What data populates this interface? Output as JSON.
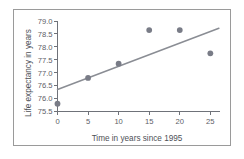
{
  "chart_data": {
    "type": "scatter",
    "title": "",
    "subtitle": "",
    "xlabel": "Time in years since 1995",
    "ylabel": "Life expectancy in years",
    "xlim": [
      0,
      26.5
    ],
    "ylim": [
      75.5,
      79.0
    ],
    "xticks": [
      0,
      5,
      10,
      15,
      20,
      25
    ],
    "xtick_labels": [
      "0",
      "5",
      "10",
      "15",
      "20",
      "25"
    ],
    "yticks": [
      75.5,
      76.0,
      76.5,
      77.0,
      77.5,
      78.0,
      78.5,
      79.0
    ],
    "ytick_labels": [
      "75.5",
      "76.0",
      "76.5",
      "77.0",
      "77.5",
      "78.0",
      "78.5",
      "79.0"
    ],
    "grid": false,
    "legend": null,
    "x": [
      0,
      5,
      10,
      15,
      20,
      25
    ],
    "y": [
      75.8,
      76.8,
      77.35,
      78.65,
      78.65,
      77.75
    ],
    "points": [
      {
        "x": 0,
        "y": 75.8
      },
      {
        "x": 5,
        "y": 76.8
      },
      {
        "x": 10,
        "y": 77.35
      },
      {
        "x": 15,
        "y": 78.65
      },
      {
        "x": 20,
        "y": 78.65
      },
      {
        "x": 25,
        "y": 77.75
      }
    ],
    "series": [
      {
        "name": "Life expectancy observations",
        "type": "scatter",
        "marker": "circle",
        "color": "#797c87",
        "x": [
          0,
          5,
          10,
          15,
          20,
          25
        ],
        "values": [
          75.8,
          76.8,
          77.35,
          78.65,
          78.65,
          77.75
        ]
      },
      {
        "name": "Line of best fit",
        "type": "line",
        "color": "#8a8d94",
        "x": [
          0,
          26.4
        ],
        "values": [
          76.35,
          78.72
        ]
      }
    ],
    "trend_line": {
      "x_start": 0,
      "y_start": 76.35,
      "x_end": 26.4,
      "y_end": 78.72
    },
    "colors": {
      "marker": "#797c87",
      "trend_line": "#8a8d94",
      "axis": "#6f7279",
      "text": "#5d6066",
      "frame": "#9a9a9a",
      "background": "#ffffff"
    }
  }
}
